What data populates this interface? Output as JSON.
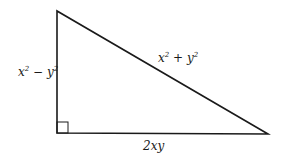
{
  "diagram": {
    "type": "right-triangle",
    "stroke_color": "#1a1a1a",
    "vertices": {
      "top": [
        57,
        11
      ],
      "right_angle": [
        57,
        133
      ],
      "right": [
        268,
        134
      ]
    },
    "labels": {
      "vertical_leg": {
        "base1": "x",
        "exp1": "2",
        "op": " − ",
        "base2": "y",
        "exp2": "2"
      },
      "hypotenuse": {
        "base1": "x",
        "exp1": "2",
        "op": " + ",
        "base2": "y",
        "exp2": "2"
      },
      "horizontal_leg": "2xy"
    },
    "right_angle_marker": true
  }
}
